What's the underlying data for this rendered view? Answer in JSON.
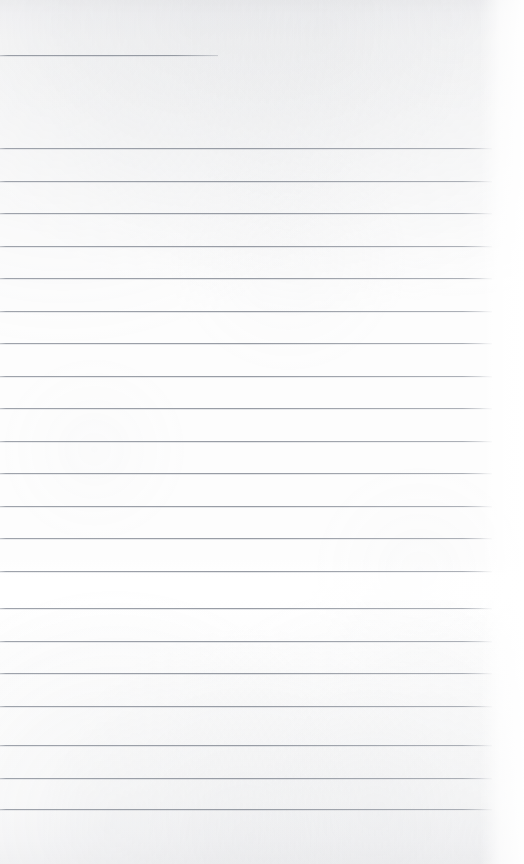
{
  "document": {
    "kind": "scanned-ruled-notepad-page",
    "title": "Ruled notepad page",
    "content_text": "",
    "page_width": 524,
    "page_height": 864,
    "paper_color": "#fdfdfd",
    "rule_color": "#969ba4",
    "is_blank": true,
    "handwriting_present": false,
    "printed_text_present": false
  },
  "header_rule": {
    "label": "header rule",
    "y": 55,
    "x_start": 0,
    "x_end": 218,
    "thickness": 1
  },
  "rules": {
    "label": "horizontal ruled lines",
    "count": 21,
    "x_start": 0,
    "x_end": 492,
    "spacing": 32.5,
    "thickness": 1,
    "y_positions": [
      148,
      180.5,
      213,
      245.5,
      278,
      310.5,
      343,
      375.5,
      408,
      440.5,
      473,
      505.5,
      538,
      570.5,
      608,
      640.5,
      673,
      705.5,
      745,
      777.5,
      809
    ]
  },
  "artifacts": {
    "fold_band": {
      "label": "light fold band",
      "y": 572,
      "height": 28
    },
    "right_margin": {
      "label": "bright right margin",
      "width": 44
    }
  }
}
